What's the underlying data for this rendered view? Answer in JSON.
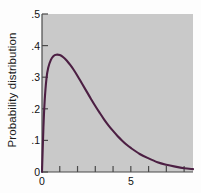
{
  "chart_data": {
    "type": "line",
    "title": "",
    "subtitle": "",
    "xlabel": "",
    "ylabel": "Probability distribution",
    "xlim": [
      0,
      8.5
    ],
    "ylim": [
      0,
      0.5
    ],
    "grid": false,
    "legend": null,
    "legend_position": "none",
    "line_color": "#4c1f43",
    "plot_background": "#c9c9c9",
    "page_background": "#fdfdfd",
    "axis_color": "#4a4a4a",
    "y_ticks": [
      {
        "value": 0.5,
        "label": ".5"
      },
      {
        "value": 0.4,
        "label": ".4"
      },
      {
        "value": 0.3,
        "label": ".3"
      },
      {
        "value": 0.2,
        "label": ".2"
      },
      {
        "value": 0.1,
        "label": ".1"
      },
      {
        "value": 0.0,
        "label": "0"
      }
    ],
    "x_ticks": [
      {
        "value": 0,
        "label": "0"
      },
      {
        "value": 1,
        "label": ""
      },
      {
        "value": 2,
        "label": ""
      },
      {
        "value": 3,
        "label": ""
      },
      {
        "value": 4,
        "label": ""
      },
      {
        "value": 5,
        "label": "5"
      },
      {
        "value": 6,
        "label": ""
      },
      {
        "value": 7,
        "label": ""
      },
      {
        "value": 8,
        "label": ""
      }
    ],
    "series": [
      {
        "name": "Probability distribution",
        "color": "#4c1f43",
        "x": [
          0.0,
          0.08,
          0.15,
          0.25,
          0.35,
          0.5,
          0.65,
          0.8,
          1.0,
          1.2,
          1.4,
          1.6,
          1.8,
          2.0,
          2.25,
          2.5,
          2.75,
          3.0,
          3.25,
          3.5,
          3.75,
          4.0,
          4.25,
          4.5,
          4.75,
          5.0,
          5.5,
          6.0,
          6.5,
          7.0,
          7.5,
          8.0,
          8.5
        ],
        "y": [
          0.0,
          0.14,
          0.225,
          0.295,
          0.33,
          0.355,
          0.367,
          0.371,
          0.37,
          0.363,
          0.352,
          0.338,
          0.322,
          0.304,
          0.28,
          0.256,
          0.232,
          0.209,
          0.187,
          0.166,
          0.147,
          0.13,
          0.114,
          0.1,
          0.087,
          0.076,
          0.057,
          0.043,
          0.031,
          0.023,
          0.017,
          0.012,
          0.009
        ]
      }
    ]
  }
}
